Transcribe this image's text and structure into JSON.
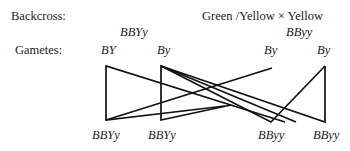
{
  "labels": {
    "backcross": "Backcross:",
    "gametes": "Gametes:"
  },
  "cross": {
    "text": "Green /Yellow × Yellow"
  },
  "parents": {
    "left_genotype": "BBYy",
    "right_genotype": "BByy"
  },
  "gametes": [
    {
      "label": "BY"
    },
    {
      "label": "By"
    },
    {
      "label": "By"
    },
    {
      "label": "By"
    }
  ],
  "offspring": [
    {
      "label": "BBYy"
    },
    {
      "label": "BBYy"
    },
    {
      "label": "BByy"
    },
    {
      "label": "BByy"
    }
  ],
  "line_color": "#111111"
}
